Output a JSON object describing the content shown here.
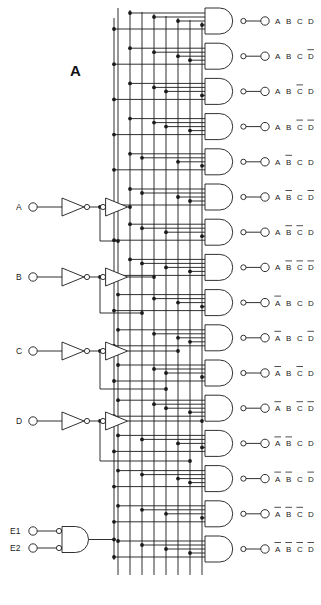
{
  "figure": {
    "label": "A"
  },
  "inputs": {
    "data": [
      {
        "name": "A",
        "label": "A",
        "y": 207
      },
      {
        "name": "B",
        "label": "B",
        "y": 277
      },
      {
        "name": "C",
        "label": "C",
        "y": 351
      },
      {
        "name": "D",
        "label": "D",
        "y": 421
      }
    ],
    "enable": [
      {
        "name": "E1",
        "label": "E1",
        "y": 531
      },
      {
        "name": "E2",
        "label": "E2",
        "y": 548
      }
    ]
  },
  "bus": {
    "columns": [
      {
        "id": "Anot",
        "x": 118,
        "signal": "A-complement"
      },
      {
        "id": "A",
        "x": 130,
        "signal": "A-true"
      },
      {
        "id": "Bnot",
        "x": 142,
        "signal": "B-complement"
      },
      {
        "id": "B",
        "x": 154,
        "signal": "B-true"
      },
      {
        "id": "Cnot",
        "x": 166,
        "signal": "C-complement"
      },
      {
        "id": "C",
        "x": 178,
        "signal": "C-true"
      },
      {
        "id": "Dnot",
        "x": 190,
        "signal": "D-complement"
      },
      {
        "id": "D",
        "x": 202,
        "signal": "D-true"
      }
    ]
  },
  "gates": {
    "count": 16,
    "type": "NAND",
    "first_y": 21,
    "pitch": 35.2,
    "outputs": [
      {
        "index": 0,
        "terms": [
          "A",
          "B",
          "C",
          "D"
        ],
        "bars": [
          false,
          false,
          false,
          false
        ]
      },
      {
        "index": 1,
        "terms": [
          "A",
          "B",
          "C",
          "D"
        ],
        "bars": [
          false,
          false,
          false,
          true
        ]
      },
      {
        "index": 2,
        "terms": [
          "A",
          "B",
          "C",
          "D"
        ],
        "bars": [
          false,
          false,
          true,
          false
        ]
      },
      {
        "index": 3,
        "terms": [
          "A",
          "B",
          "C",
          "D"
        ],
        "bars": [
          false,
          false,
          true,
          true
        ]
      },
      {
        "index": 4,
        "terms": [
          "A",
          "B",
          "C",
          "D"
        ],
        "bars": [
          false,
          true,
          false,
          false
        ]
      },
      {
        "index": 5,
        "terms": [
          "A",
          "B",
          "C",
          "D"
        ],
        "bars": [
          false,
          true,
          false,
          true
        ]
      },
      {
        "index": 6,
        "terms": [
          "A",
          "B",
          "C",
          "D"
        ],
        "bars": [
          false,
          true,
          true,
          false
        ]
      },
      {
        "index": 7,
        "terms": [
          "A",
          "B",
          "C",
          "D"
        ],
        "bars": [
          false,
          true,
          true,
          true
        ]
      },
      {
        "index": 8,
        "terms": [
          "A",
          "B",
          "C",
          "D"
        ],
        "bars": [
          true,
          false,
          false,
          false
        ]
      },
      {
        "index": 9,
        "terms": [
          "A",
          "B",
          "C",
          "D"
        ],
        "bars": [
          true,
          false,
          false,
          true
        ]
      },
      {
        "index": 10,
        "terms": [
          "A",
          "B",
          "C",
          "D"
        ],
        "bars": [
          true,
          false,
          true,
          false
        ]
      },
      {
        "index": 11,
        "terms": [
          "A",
          "B",
          "C",
          "D"
        ],
        "bars": [
          true,
          false,
          true,
          true
        ]
      },
      {
        "index": 12,
        "terms": [
          "A",
          "B",
          "C",
          "D"
        ],
        "bars": [
          true,
          true,
          false,
          false
        ]
      },
      {
        "index": 13,
        "terms": [
          "A",
          "B",
          "C",
          "D"
        ],
        "bars": [
          true,
          true,
          false,
          true
        ]
      },
      {
        "index": 14,
        "terms": [
          "A",
          "B",
          "C",
          "D"
        ],
        "bars": [
          true,
          true,
          true,
          false
        ]
      },
      {
        "index": 15,
        "terms": [
          "A",
          "B",
          "C",
          "D"
        ],
        "bars": [
          true,
          true,
          true,
          true
        ]
      }
    ]
  },
  "colors": {
    "wire": "#1a1a1a",
    "background": "#ffffff",
    "text": "#222222"
  }
}
